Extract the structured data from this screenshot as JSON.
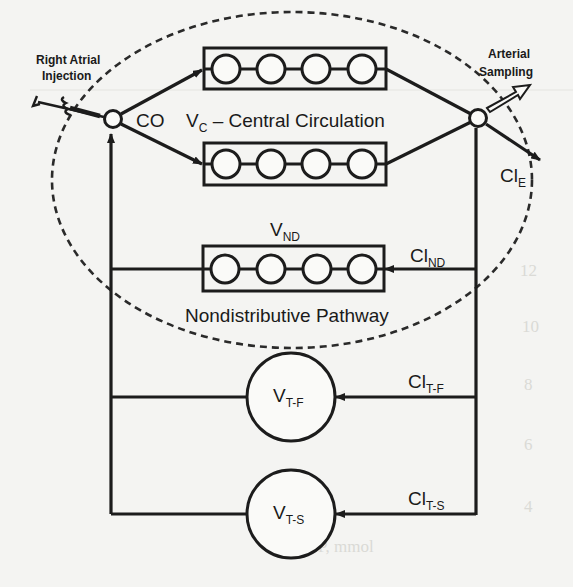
{
  "diagram": {
    "injection_label_line1": "Right Atrial",
    "injection_label_line2": "Injection",
    "sampling_label_line1": "Arterial",
    "sampling_label_line2": "Sampling",
    "cardiac_output": "CO",
    "central_volume_main": "V",
    "central_volume_sub": "C",
    "central_volume_desc": " – Central Circulation",
    "clearance_e_main": "Cl",
    "clearance_e_sub": "E",
    "nd_volume_main": "V",
    "nd_volume_sub": "ND",
    "nd_clearance_main": "Cl",
    "nd_clearance_sub": "ND",
    "nd_pathway_label": "Nondistributive Pathway",
    "tf_volume_main": "V",
    "tf_volume_sub": "T-F",
    "tf_clearance_main": "Cl",
    "tf_clearance_sub": "T-F",
    "ts_volume_main": "V",
    "ts_volume_sub": "T-S",
    "ts_clearance_main": "Cl",
    "ts_clearance_sub": "T-S",
    "compartment_circle_counts": {
      "central_upper": 4,
      "central_lower": 4,
      "nondistributive": 4
    }
  },
  "background_bleed_text": {
    "note": "faint show-through from reverse page",
    "axis_ticks_right": [
      "12",
      "10",
      "8",
      "6",
      "4"
    ],
    "axis_caption": "P, mmol"
  }
}
